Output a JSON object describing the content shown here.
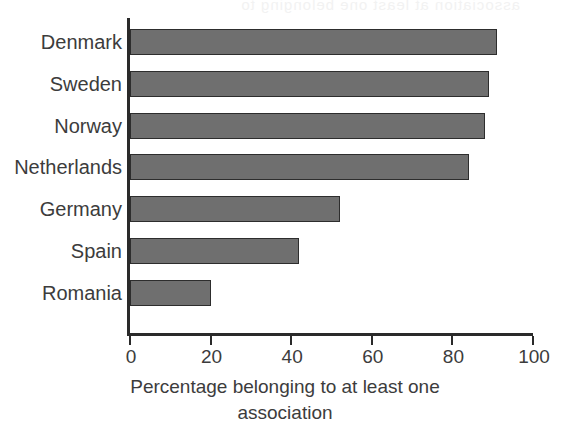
{
  "figure": {
    "ghost_bleed_text": "association at least one belonging to",
    "bar_color": "#6f6f6f",
    "bar_border_color": "#2d2d2d",
    "axis_color": "#2a2a2a",
    "text_color": "#3c3c3c"
  },
  "chart_data": {
    "type": "bar",
    "orientation": "horizontal",
    "title": "",
    "subtitle": "",
    "xlabel": "Percentage belonging to at least one association",
    "xlabel_line1": "Percentage belonging to at least one",
    "xlabel_line2": "association",
    "ylabel": "",
    "categories": [
      "Denmark",
      "Sweden",
      "Norway",
      "Netherlands",
      "Germany",
      "Spain",
      "Romania"
    ],
    "values": [
      91,
      89,
      88,
      84,
      52,
      42,
      20
    ],
    "xlim": [
      0,
      100
    ],
    "xticks": [
      0,
      20,
      40,
      60,
      80,
      100
    ],
    "xtick_labels": [
      "0",
      "20",
      "40",
      "60",
      "80",
      "100"
    ],
    "grid": false,
    "legend": false,
    "legend_position": "none",
    "bar_color": "#6f6f6f"
  }
}
